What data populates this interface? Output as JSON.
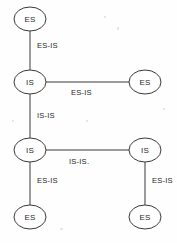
{
  "diagram": {
    "type": "network-topology",
    "background_color": "#fefefe",
    "stroke_color": "#3a3a3a",
    "text_color": "#1f1f1f",
    "nodes": [
      {
        "id": "es-top-left",
        "label": "ES",
        "cx": 30,
        "cy": 19,
        "rx": 16,
        "ry": 12
      },
      {
        "id": "is-upper-left",
        "label": "IS",
        "cx": 30,
        "cy": 82,
        "rx": 16,
        "ry": 12
      },
      {
        "id": "es-upper-right",
        "label": "ES",
        "cx": 145,
        "cy": 82,
        "rx": 16,
        "ry": 12
      },
      {
        "id": "is-lower-left",
        "label": "IS",
        "cx": 30,
        "cy": 150,
        "rx": 16,
        "ry": 12
      },
      {
        "id": "is-lower-right",
        "label": "IS",
        "cx": 145,
        "cy": 150,
        "rx": 16,
        "ry": 12
      },
      {
        "id": "es-bottom-left",
        "label": "ES",
        "cx": 30,
        "cy": 217,
        "rx": 16,
        "ry": 12
      },
      {
        "id": "es-bottom-right",
        "label": "ES",
        "cx": 145,
        "cy": 217,
        "rx": 16,
        "ry": 12
      }
    ],
    "edges": [
      {
        "id": "edge-es-top-to-is-upper",
        "from": "es-top-left",
        "to": "is-upper-left",
        "label": "ES-IS",
        "orientation": "vertical",
        "x1": 30,
        "y1": 31,
        "x2": 30,
        "y2": 70,
        "label_x": 37,
        "label_y": 48
      },
      {
        "id": "edge-is-upper-to-es-right",
        "from": "is-upper-left",
        "to": "es-upper-right",
        "label": "ES-IS",
        "orientation": "horizontal",
        "x1": 46,
        "y1": 82,
        "x2": 129,
        "y2": 82,
        "label_x": 71,
        "label_y": 95
      },
      {
        "id": "edge-is-upper-to-is-lower",
        "from": "is-upper-left",
        "to": "is-lower-left",
        "label": "IS-IS",
        "orientation": "vertical",
        "x1": 30,
        "y1": 94,
        "x2": 30,
        "y2": 138,
        "label_x": 37,
        "label_y": 118
      },
      {
        "id": "edge-is-lower-to-is-right",
        "from": "is-lower-left",
        "to": "is-lower-right",
        "label": "IS-IS.",
        "orientation": "horizontal",
        "x1": 46,
        "y1": 150,
        "x2": 129,
        "y2": 150,
        "label_x": 69,
        "label_y": 164
      },
      {
        "id": "edge-is-lower-to-es-bottom",
        "from": "is-lower-left",
        "to": "es-bottom-left",
        "label": "ES-IS",
        "orientation": "vertical",
        "x1": 30,
        "y1": 162,
        "x2": 30,
        "y2": 205,
        "label_x": 37,
        "label_y": 183
      },
      {
        "id": "edge-is-right-to-es-bottom-right",
        "from": "is-lower-right",
        "to": "es-bottom-right",
        "label": "ES-IS",
        "orientation": "vertical",
        "x1": 145,
        "y1": 162,
        "x2": 145,
        "y2": 205,
        "label_x": 152,
        "label_y": 183
      }
    ]
  }
}
